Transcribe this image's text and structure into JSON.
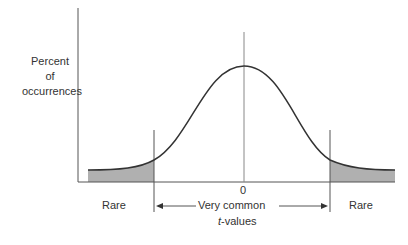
{
  "ylabel": [
    "Percent",
    "of",
    "occurrences"
  ],
  "zero_label": "0",
  "left_region": "Rare",
  "right_region": "Rare",
  "middle_region": "Very common",
  "xlabel_italic": "t",
  "xlabel_rest": "-values",
  "colors": {
    "shade": "#b0b0b0",
    "line": "#333333",
    "axis": "#555555"
  }
}
